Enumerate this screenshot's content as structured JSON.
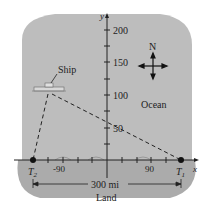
{
  "diagram": {
    "regions": {
      "ocean_label": "Ocean",
      "land_label": "Land"
    },
    "axes": {
      "x_label": "x",
      "y_label": "y",
      "y_ticks": [
        "50",
        "100",
        "150",
        "200"
      ],
      "x_ticks": [
        "-90",
        "90"
      ]
    },
    "points": {
      "t1": {
        "label": "T",
        "sub": "1"
      },
      "t2": {
        "label": "T",
        "sub": "2"
      },
      "ship": {
        "label": "Ship"
      }
    },
    "compass": {
      "north_label": "N"
    },
    "dimension": {
      "label": "300 mi"
    },
    "colors": {
      "ocean": "#bdbdbd",
      "land": "#a8a8a8",
      "background": "#ffffff",
      "ink": "#222222"
    }
  }
}
